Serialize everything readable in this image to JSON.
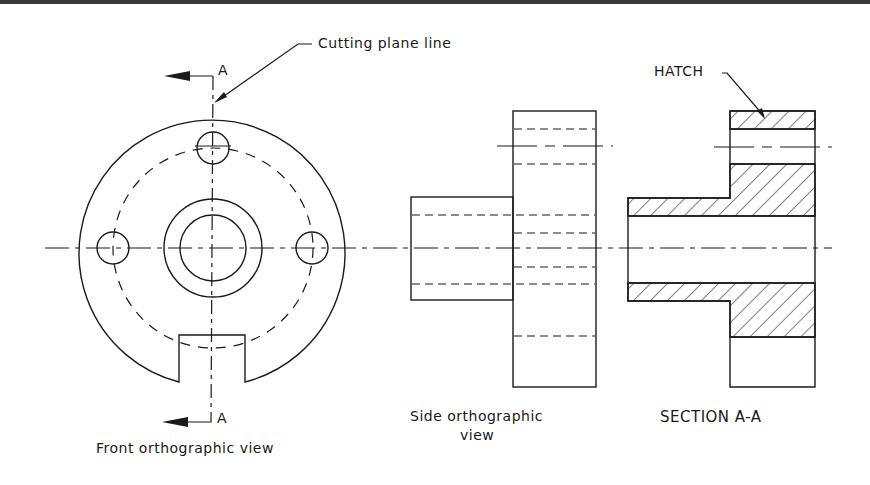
{
  "drawing": {
    "type": "orthographic engineering drawing",
    "colors": {
      "line": "#1a1a1a",
      "border": "#3a3a3a",
      "background": "#ffffff"
    },
    "annotations": {
      "cutting_plane_label": "Cutting plane line",
      "section_marker_top": "A",
      "section_marker_bottom": "A",
      "hatch_label": "HATCH"
    },
    "views": {
      "front": {
        "caption": "Front orthographic view"
      },
      "side": {
        "caption_line1": "Side orthographic",
        "caption_line2": "view"
      },
      "section": {
        "caption": "SECTION A-A"
      }
    }
  }
}
